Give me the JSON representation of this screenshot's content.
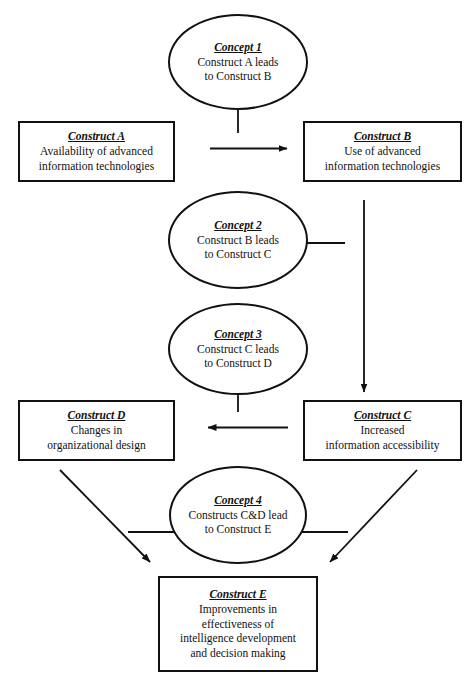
{
  "diagram": {
    "stroke_color": "#111111",
    "background_color": "#ffffff",
    "nodes": [
      {
        "id": "concept1",
        "shape": "ellipse",
        "title": "Concept 1",
        "lines": [
          "Construct A leads",
          "to Construct B"
        ]
      },
      {
        "id": "construct_a",
        "shape": "box",
        "title": "Construct A",
        "lines": [
          "Availability of advanced",
          "information technologies"
        ]
      },
      {
        "id": "construct_b",
        "shape": "box",
        "title": "Construct B",
        "lines": [
          "Use of advanced",
          "information technologies"
        ]
      },
      {
        "id": "concept2",
        "shape": "ellipse",
        "title": "Concept 2",
        "lines": [
          "Construct B leads",
          "to Construct C"
        ]
      },
      {
        "id": "concept3",
        "shape": "ellipse",
        "title": "Concept 3",
        "lines": [
          "Construct C leads",
          "to Construct D"
        ]
      },
      {
        "id": "construct_d",
        "shape": "box",
        "title": "Construct D",
        "lines": [
          "Changes in",
          "organizational design"
        ]
      },
      {
        "id": "construct_c",
        "shape": "box",
        "title": "Construct C",
        "lines": [
          "Increased",
          "information accessibility"
        ]
      },
      {
        "id": "concept4",
        "shape": "ellipse",
        "title": "Concept 4",
        "lines": [
          "Constructs C&D lead",
          "to Construct E"
        ]
      },
      {
        "id": "construct_e",
        "shape": "box",
        "title": "Construct E",
        "lines": [
          "Improvements in",
          "effectiveness of",
          "intelligence development",
          "and decision making"
        ]
      }
    ],
    "connectors": [
      {
        "id": "a-to-b",
        "kind": "arrow",
        "from": "construct_a",
        "to": "construct_b",
        "direction": "right"
      },
      {
        "id": "concept1-tick",
        "kind": "tick",
        "from": "concept1",
        "direction": "down"
      },
      {
        "id": "b-to-c",
        "kind": "arrow",
        "from": "construct_b",
        "to": "construct_c",
        "direction": "down"
      },
      {
        "id": "concept2-tick",
        "kind": "tick",
        "from": "concept2",
        "direction": "right"
      },
      {
        "id": "c-to-d",
        "kind": "arrow",
        "from": "construct_c",
        "to": "construct_d",
        "direction": "left"
      },
      {
        "id": "concept3-tick",
        "kind": "tick",
        "from": "concept3",
        "direction": "down"
      },
      {
        "id": "d-to-e",
        "kind": "arrow",
        "from": "construct_d",
        "to": "construct_e",
        "direction": "down-right"
      },
      {
        "id": "c-to-e",
        "kind": "arrow",
        "from": "construct_c",
        "to": "construct_e",
        "direction": "down-left"
      },
      {
        "id": "concept4-tick-left",
        "kind": "tick",
        "from": "concept4",
        "direction": "left"
      },
      {
        "id": "concept4-tick-right",
        "kind": "tick",
        "from": "concept4",
        "direction": "right"
      }
    ]
  }
}
